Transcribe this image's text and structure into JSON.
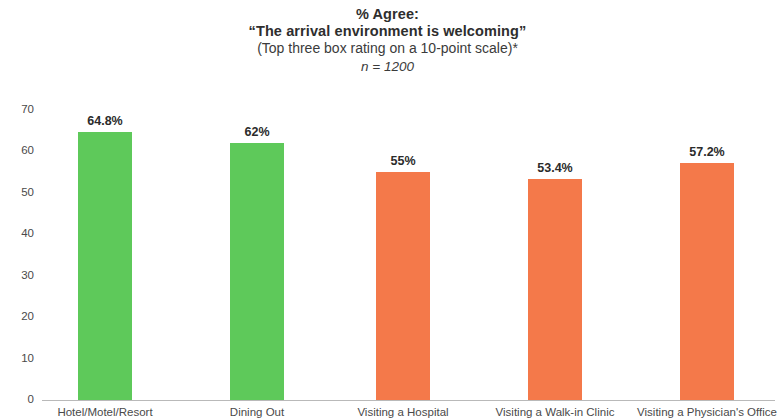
{
  "title": {
    "line1": "% Agree:",
    "line2": "“The arrival environment is welcoming”",
    "line3": "(Top three box rating on a 10-point scale)*",
    "line4": "n = 1200"
  },
  "colors": {
    "green": "#5ec95a",
    "orange": "#f4794a",
    "axis": "#b9b9b9",
    "text": "#3a3a3a"
  },
  "chart_data": {
    "type": "bar",
    "title": "% Agree: “The arrival environment is welcoming” (Top three box rating on a 10-point scale)* n = 1200",
    "xlabel": "",
    "ylabel": "",
    "ylim": [
      0,
      70
    ],
    "yticks": [
      0,
      10,
      20,
      30,
      40,
      50,
      60,
      70
    ],
    "ytick_labels": [
      "0",
      "10",
      "20",
      "30",
      "40",
      "50",
      "60",
      "70"
    ],
    "grid": false,
    "legend": "none",
    "categories": [
      "Hotel/Motel/Resort",
      "Dining Out",
      "Visiting a Hospital",
      "Visiting a Walk-in Clinic",
      "Visiting a Physician's Office"
    ],
    "values": [
      64.8,
      62,
      55,
      53.4,
      57.2
    ],
    "value_labels": [
      "64.8%",
      "62%",
      "55%",
      "53.4%",
      "57.2%"
    ],
    "bar_colors": [
      "#5ec95a",
      "#5ec95a",
      "#f4794a",
      "#f4794a",
      "#f4794a"
    ]
  }
}
